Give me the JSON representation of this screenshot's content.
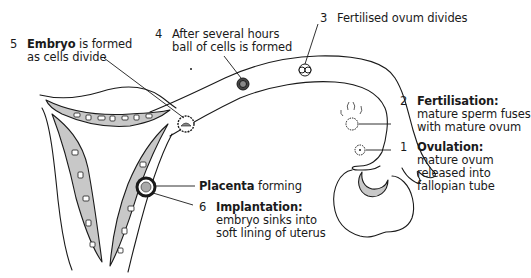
{
  "diagram": {
    "colors": {
      "outline": "#1a1a1a",
      "lining_fill": "#c8c8c8",
      "background": "#ffffff"
    }
  },
  "stages": [
    {
      "number": "1",
      "title": "Ovulation:",
      "lines": [
        "mature ovum",
        "released into",
        "fallopian tube"
      ]
    },
    {
      "number": "2",
      "title": "Fertilisation:",
      "lines": [
        "mature sperm fuses",
        "with mature ovum"
      ]
    },
    {
      "number": "3",
      "title": "",
      "lines": [
        "Fertilised ovum divides"
      ]
    },
    {
      "number": "4",
      "title": "",
      "lines": [
        "After several hours",
        "ball of cells is formed"
      ]
    },
    {
      "number": "5",
      "title": "Embryo",
      "title_suffix": " is formed",
      "lines": [
        "as cells divide"
      ]
    },
    {
      "number": "6",
      "title": "Implantation:",
      "lines": [
        "embryo sinks into",
        "soft lining of uterus"
      ]
    }
  ],
  "extra_labels": {
    "placenta": {
      "bold": "Placenta",
      "rest": " forming"
    }
  }
}
